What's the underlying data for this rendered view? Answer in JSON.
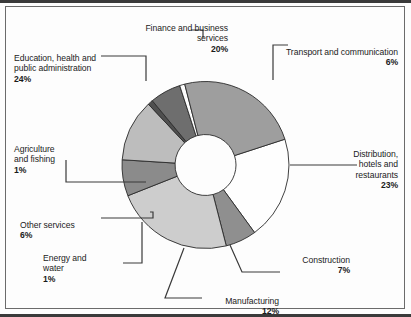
{
  "figure": {
    "background": "#fdfdfd",
    "rule_color": "#3a3a3a",
    "frame_color": "#6b6b6b",
    "leader_color": "#3a3a3a",
    "slice_outline": "#2b2b2b"
  },
  "chart_data": {
    "type": "pie",
    "variant": "donut",
    "title": "",
    "subtitle": "",
    "xlabel": "",
    "ylabel": "",
    "legend_position": "callout-labels",
    "grid": false,
    "units": "percent",
    "total": 100,
    "inner_radius_ratio": 0.365,
    "start_angle_deg": -18,
    "direction": "clockwise",
    "categories": [
      "Finance and business services",
      "Transport and communication",
      "Distribution, hotels and restaurants",
      "Construction",
      "Manufacturing",
      "Energy and water",
      "Other services",
      "Agriculture and fishing",
      "Education, health and public administration"
    ],
    "values": [
      20,
      6,
      23,
      7,
      12,
      1,
      6,
      1,
      24
    ],
    "colors": [
      "#fefefe",
      "#8f8f8f",
      "#cdcdcd",
      "#8b8b8b",
      "#bdbdbd",
      "#4f4f4f",
      "#6e6e6e",
      "#fcfcfc",
      "#9e9e9e"
    ],
    "slices": [
      {
        "label": "Finance and business services",
        "value": 20,
        "display": "20%",
        "color": "#fefefe"
      },
      {
        "label": "Transport and communication",
        "value": 6,
        "display": "6%",
        "color": "#8f8f8f"
      },
      {
        "label": "Distribution, hotels and restaurants",
        "value": 23,
        "display": "23%",
        "color": "#cdcdcd"
      },
      {
        "label": "Construction",
        "value": 7,
        "display": "7%",
        "color": "#8b8b8b"
      },
      {
        "label": "Manufacturing",
        "value": 12,
        "display": "12%",
        "color": "#bdbdbd"
      },
      {
        "label": "Energy and water",
        "value": 1,
        "display": "1%",
        "color": "#4f4f4f"
      },
      {
        "label": "Other services",
        "value": 6,
        "display": "6%",
        "color": "#6e6e6e"
      },
      {
        "label": "Agriculture and fishing",
        "value": 1,
        "display": "1%",
        "color": "#fcfcfc"
      },
      {
        "label": "Education, health and public administration",
        "value": 24,
        "display": "24%",
        "color": "#9e9e9e"
      }
    ]
  },
  "callouts": {
    "finance": {
      "name": "Finance and business services",
      "value": "20%"
    },
    "transport": {
      "name": "Transport and communication",
      "value": "6%"
    },
    "distribution": {
      "name": "Distribution,\nhotels and\nrestaurants",
      "value": "23%"
    },
    "construction": {
      "name": "Construction",
      "value": "7%"
    },
    "manufacturing": {
      "name": "Manufacturing",
      "value": "12%"
    },
    "energy": {
      "name": "Energy and\nwater",
      "value": "1%"
    },
    "other_services": {
      "name": "Other services",
      "value": "6%"
    },
    "agriculture": {
      "name": "Agriculture\nand fishing",
      "value": "1%"
    },
    "education": {
      "name": "Education, health and\npublic administration",
      "value": "24%"
    }
  }
}
